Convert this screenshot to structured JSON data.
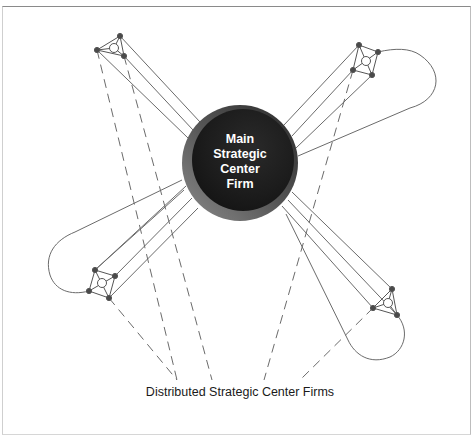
{
  "figure": {
    "caption_partial": "Figure 11.3 — Strategic Network",
    "center_node": {
      "label_lines": [
        "Main",
        "Strategic",
        "Center",
        "Firm"
      ],
      "fill_dark": "#1e1e1e",
      "rim_light": "#6a6a6a"
    },
    "bottom_label": "Distributed Strategic Center Firms",
    "colors": {
      "line": "#6b6b6b",
      "node": "#4a4a4a",
      "frame": "#8a8a8a"
    },
    "clusters": [
      {
        "id": "top-left",
        "nodes": [
          [
            97,
            50
          ],
          [
            120,
            36
          ],
          [
            124,
            56
          ]
        ],
        "hub": [
          114,
          48
        ]
      },
      {
        "id": "top-right",
        "nodes": [
          [
            359,
            45
          ],
          [
            378,
            52
          ],
          [
            353,
            70
          ],
          [
            372,
            75
          ]
        ],
        "hub": [
          366,
          61
        ]
      },
      {
        "id": "bottom-left",
        "nodes": [
          [
            95,
            270
          ],
          [
            115,
            276
          ],
          [
            89,
            291
          ],
          [
            109,
            298
          ]
        ],
        "hub": [
          102,
          283
        ]
      },
      {
        "id": "bottom-right",
        "nodes": [
          [
            392,
            289
          ],
          [
            373,
            308
          ],
          [
            397,
            315
          ]
        ],
        "hub": [
          388,
          303
        ]
      }
    ]
  }
}
